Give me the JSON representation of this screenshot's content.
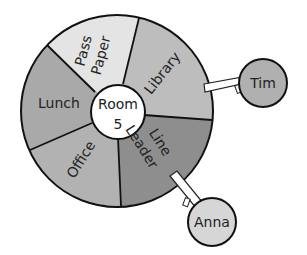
{
  "diagram": {
    "type": "job-wheel",
    "center": {
      "line1": "Room",
      "line2": "5"
    },
    "segments": [
      {
        "label_lines": [
          "Pass",
          "Paper"
        ],
        "color": "#e4e4e4"
      },
      {
        "label_lines": [
          "Library"
        ],
        "color": "#bdbdbd"
      },
      {
        "label_lines": [
          "Line",
          "Leader"
        ],
        "color": "#8e8e8e"
      },
      {
        "label_lines": [
          "Office"
        ],
        "color": "#b2b2b2"
      },
      {
        "label_lines": [
          "Lunch"
        ],
        "color": "#a9a9a9"
      }
    ],
    "tags": [
      {
        "name": "Tim",
        "attached_to": "Library",
        "color": "#b0b0b0"
      },
      {
        "name": "Anna",
        "attached_to": "Line Leader",
        "color": "#d6d6d6"
      }
    ]
  }
}
